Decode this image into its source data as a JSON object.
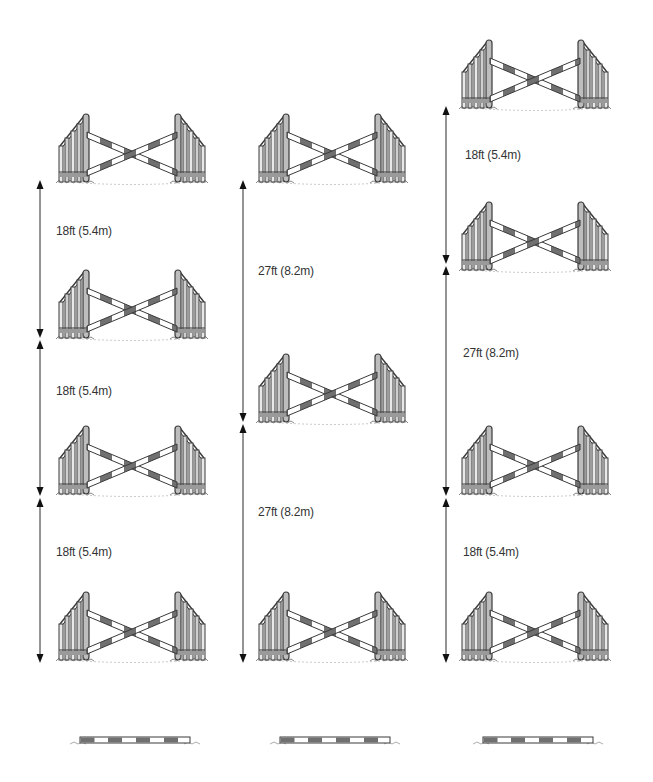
{
  "diagram": {
    "colors": {
      "pole_dark": "#6e6e6e",
      "pole_light": "#ffffff",
      "outline": "#3a3a3a",
      "text": "#333333",
      "ground": "#8a8a8a"
    },
    "columns": [
      {
        "name": "grid-1",
        "fences": [
          {
            "type": "cross-pole",
            "x": 52,
            "y": 112
          },
          {
            "type": "cross-pole",
            "x": 52,
            "y": 268
          },
          {
            "type": "cross-pole",
            "x": 52,
            "y": 424
          },
          {
            "type": "cross-pole",
            "x": 52,
            "y": 590
          }
        ],
        "distances": [
          {
            "label": "18ft (5.4m)",
            "feet": 18,
            "metres": 5.4,
            "arrow_x": 40,
            "top": 180,
            "bottom": 338,
            "label_x": 56,
            "label_y": 224
          },
          {
            "label": "18ft (5.4m)",
            "feet": 18,
            "metres": 5.4,
            "arrow_x": 40,
            "top": 340,
            "bottom": 496,
            "label_x": 56,
            "label_y": 384
          },
          {
            "label": "18ft (5.4m)",
            "feet": 18,
            "metres": 5.4,
            "arrow_x": 40,
            "top": 498,
            "bottom": 663,
            "label_x": 56,
            "label_y": 545
          }
        ],
        "ground_pole": {
          "label": "ground pole",
          "x": 70,
          "y": 733
        }
      },
      {
        "name": "grid-2",
        "fences": [
          {
            "type": "cross-pole",
            "x": 252,
            "y": 112
          },
          {
            "type": "cross-pole",
            "x": 252,
            "y": 352
          },
          {
            "type": "cross-pole",
            "x": 252,
            "y": 590
          }
        ],
        "distances": [
          {
            "label": "27ft (8.2m)",
            "feet": 27,
            "metres": 8.2,
            "arrow_x": 243,
            "top": 180,
            "bottom": 422,
            "label_x": 258,
            "label_y": 264
          },
          {
            "label": "27ft (8.2m)",
            "feet": 27,
            "metres": 8.2,
            "arrow_x": 243,
            "top": 424,
            "bottom": 663,
            "label_x": 258,
            "label_y": 505
          }
        ],
        "ground_pole": {
          "label": "ground pole",
          "x": 270,
          "y": 733
        }
      },
      {
        "name": "grid-3",
        "fences": [
          {
            "type": "cross-pole",
            "x": 455,
            "y": 38
          },
          {
            "type": "cross-pole",
            "x": 455,
            "y": 200
          },
          {
            "type": "cross-pole",
            "x": 455,
            "y": 424
          },
          {
            "type": "cross-pole",
            "x": 455,
            "y": 590
          }
        ],
        "distances": [
          {
            "label": "18ft (5.4m)",
            "feet": 18,
            "metres": 5.4,
            "arrow_x": 446,
            "top": 106,
            "bottom": 264,
            "label_x": 465,
            "label_y": 148
          },
          {
            "label": "27ft (8.2m)",
            "feet": 27,
            "metres": 8.2,
            "arrow_x": 446,
            "top": 266,
            "bottom": 496,
            "label_x": 463,
            "label_y": 346
          },
          {
            "label": "18ft (5.4m)",
            "feet": 18,
            "metres": 5.4,
            "arrow_x": 446,
            "top": 498,
            "bottom": 663,
            "label_x": 463,
            "label_y": 545
          }
        ],
        "ground_pole": {
          "label": "ground pole",
          "x": 473,
          "y": 733
        }
      }
    ]
  }
}
